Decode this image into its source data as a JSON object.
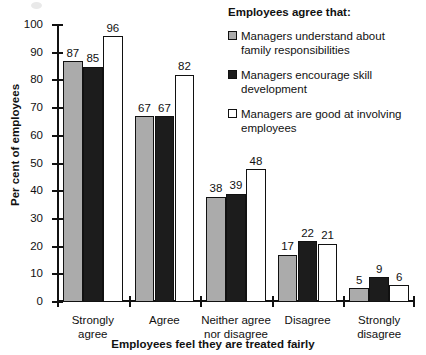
{
  "chart_data": {
    "type": "bar",
    "title": "",
    "xlabel": "Employees feel they are treated fairly",
    "ylabel": "Per cent of employees",
    "categories": [
      "Strongly agree",
      "Agree",
      "Neither agree nor disagree",
      "Disagree",
      "Strongly disagree"
    ],
    "category_lines": [
      [
        "Strongly",
        "agree"
      ],
      [
        "Agree"
      ],
      [
        "Neither agree",
        "nor disagree"
      ],
      [
        "Disagree"
      ],
      [
        "Strongly",
        "disagree"
      ]
    ],
    "series": [
      {
        "name": "Managers understand about family responsibilities",
        "color": "#ababab",
        "values": [
          87,
          67,
          38,
          17,
          5
        ]
      },
      {
        "name": "Managers encourage skill development",
        "color": "#1c1c1c",
        "values": [
          85,
          67,
          39,
          22,
          9
        ]
      },
      {
        "name": "Managers are good at involving employees",
        "color": "#ffffff",
        "values": [
          96,
          82,
          48,
          21,
          6
        ]
      }
    ],
    "ylim": [
      0,
      100
    ],
    "yticks": [
      0,
      10,
      20,
      30,
      40,
      50,
      60,
      70,
      80,
      90,
      100
    ],
    "grid": false,
    "legend_position": "top-right"
  },
  "legend": {
    "title": "Employees agree that:",
    "items": [
      {
        "label": "Managers understand about family responsibilities",
        "swatch": "gray-filled-square"
      },
      {
        "label": "Managers encourage skill development",
        "swatch": "black-filled-square"
      },
      {
        "label": "Managers are good at involving employees",
        "swatch": "white-empty-square"
      }
    ]
  }
}
